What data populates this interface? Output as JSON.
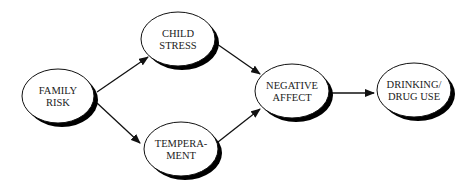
{
  "diagram": {
    "type": "path-model",
    "colors": {
      "stroke": "#111111",
      "shadow": "#000000",
      "fill": "#ffffff",
      "text": "#222222"
    },
    "nodes": [
      {
        "id": "family_risk",
        "lines": [
          "FAMILY",
          "RISK"
        ],
        "cx": 58,
        "cy": 96,
        "rx": 36,
        "ry": 27
      },
      {
        "id": "child_stress",
        "lines": [
          "CHILD",
          "STRESS"
        ],
        "cx": 178,
        "cy": 39,
        "rx": 37,
        "ry": 27
      },
      {
        "id": "temperament",
        "lines": [
          "TEMPERA-",
          "MENT"
        ],
        "cx": 181,
        "cy": 149,
        "rx": 37,
        "ry": 27
      },
      {
        "id": "negative_affect",
        "lines": [
          "NEGATIVE",
          "AFFECT"
        ],
        "cx": 292,
        "cy": 91,
        "rx": 37,
        "ry": 27
      },
      {
        "id": "drinking_drug_use",
        "lines": [
          "DRINKING/",
          "DRUG USE"
        ],
        "cx": 414,
        "cy": 90,
        "rx": 37,
        "ry": 27
      }
    ],
    "edges": [
      {
        "from": "family_risk",
        "to": "child_stress",
        "x1": 97,
        "y1": 92,
        "x2": 148,
        "y2": 57
      },
      {
        "from": "family_risk",
        "to": "temperament",
        "x1": 97,
        "y1": 103,
        "x2": 140,
        "y2": 143
      },
      {
        "from": "child_stress",
        "to": "negative_affect",
        "x1": 217,
        "y1": 44,
        "x2": 260,
        "y2": 74
      },
      {
        "from": "temperament",
        "to": "negative_affect",
        "x1": 218,
        "y1": 142,
        "x2": 260,
        "y2": 109
      },
      {
        "from": "negative_affect",
        "to": "drinking_drug_use",
        "x1": 331,
        "y1": 93,
        "x2": 374,
        "y2": 93
      }
    ]
  }
}
